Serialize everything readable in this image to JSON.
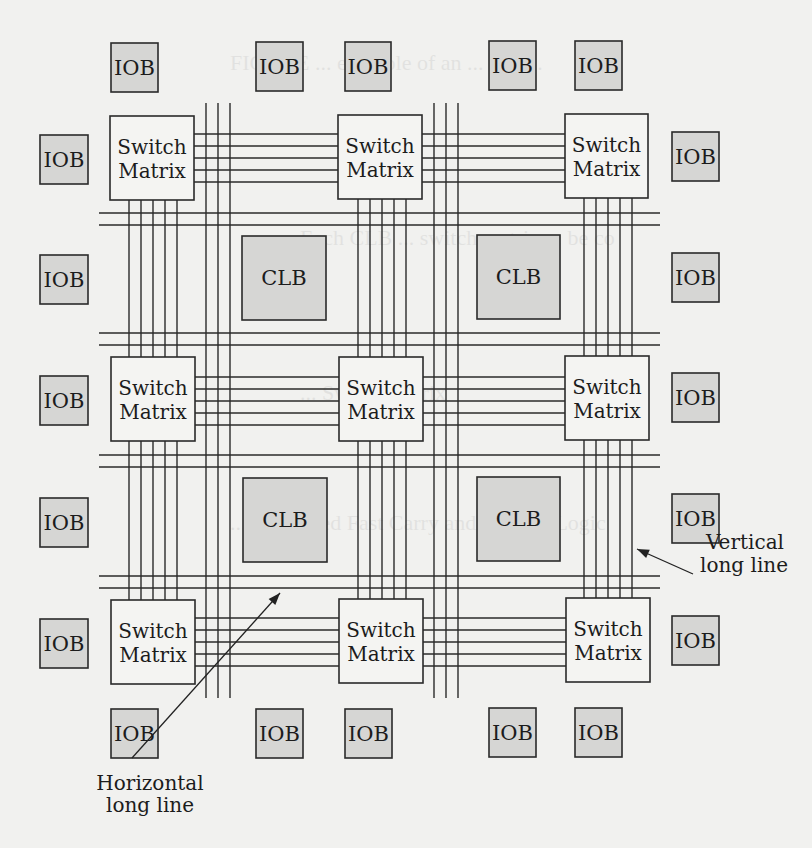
{
  "figure": {
    "colors": {
      "background": "#f1f1ef",
      "block_fill": "#d6d6d4",
      "switch_fill": "#f4f4f2",
      "stroke": "#2a2a2a"
    },
    "labels": {
      "iob": "IOB",
      "clb": "CLB",
      "switch_line1": "Switch",
      "switch_line2": "Matrix",
      "vertical_long_line_1": "Vertical",
      "vertical_long_line_2": "long line",
      "horizontal_long_line_1": "Horizontal",
      "horizontal_long_line_2": "long line"
    },
    "bleed_through_text": [
      "FIGURE ... example of an ... and ...",
      "Each CLB ... switch matrix ... be co",
      "... Switch matrix",
      "... Dedicated Fast Carry and Borrow Logic",
      "... Vertical long line"
    ]
  },
  "iobs": [
    {
      "id": "iob-top-1",
      "x": 111,
      "y": 43,
      "w": 47,
      "h": 49
    },
    {
      "id": "iob-top-2",
      "x": 256,
      "y": 42,
      "w": 47,
      "h": 49
    },
    {
      "id": "iob-top-3",
      "x": 345,
      "y": 42,
      "w": 46,
      "h": 49
    },
    {
      "id": "iob-top-4",
      "x": 489,
      "y": 41,
      "w": 47,
      "h": 49
    },
    {
      "id": "iob-top-5",
      "x": 575,
      "y": 41,
      "w": 47,
      "h": 49
    },
    {
      "id": "iob-left-1",
      "x": 40,
      "y": 135,
      "w": 48,
      "h": 49
    },
    {
      "id": "iob-left-2",
      "x": 40,
      "y": 255,
      "w": 48,
      "h": 49
    },
    {
      "id": "iob-left-3",
      "x": 40,
      "y": 376,
      "w": 48,
      "h": 49
    },
    {
      "id": "iob-left-4",
      "x": 40,
      "y": 498,
      "w": 48,
      "h": 49
    },
    {
      "id": "iob-left-5",
      "x": 40,
      "y": 619,
      "w": 48,
      "h": 49
    },
    {
      "id": "iob-right-1",
      "x": 672,
      "y": 132,
      "w": 47,
      "h": 49
    },
    {
      "id": "iob-right-2",
      "x": 672,
      "y": 253,
      "w": 47,
      "h": 49
    },
    {
      "id": "iob-right-3",
      "x": 672,
      "y": 373,
      "w": 47,
      "h": 49
    },
    {
      "id": "iob-right-4",
      "x": 672,
      "y": 494,
      "w": 47,
      "h": 49
    },
    {
      "id": "iob-right-5",
      "x": 672,
      "y": 616,
      "w": 47,
      "h": 49
    },
    {
      "id": "iob-bottom-1",
      "x": 111,
      "y": 709,
      "w": 47,
      "h": 49
    },
    {
      "id": "iob-bottom-2",
      "x": 256,
      "y": 709,
      "w": 47,
      "h": 49
    },
    {
      "id": "iob-bottom-3",
      "x": 345,
      "y": 709,
      "w": 47,
      "h": 49
    },
    {
      "id": "iob-bottom-4",
      "x": 489,
      "y": 708,
      "w": 47,
      "h": 49
    },
    {
      "id": "iob-bottom-5",
      "x": 575,
      "y": 708,
      "w": 47,
      "h": 49
    }
  ],
  "clbs": [
    {
      "id": "clb-1",
      "x": 242,
      "y": 236,
      "w": 84,
      "h": 84
    },
    {
      "id": "clb-2",
      "x": 477,
      "y": 235,
      "w": 83,
      "h": 84
    },
    {
      "id": "clb-3",
      "x": 243,
      "y": 478,
      "w": 84,
      "h": 84
    },
    {
      "id": "clb-4",
      "x": 477,
      "y": 477,
      "w": 83,
      "h": 84
    }
  ],
  "switch_matrices": [
    {
      "id": "sm-r1c1",
      "x": 110,
      "y": 116,
      "w": 84,
      "h": 84
    },
    {
      "id": "sm-r1c2",
      "x": 338,
      "y": 115,
      "w": 84,
      "h": 84
    },
    {
      "id": "sm-r1c3",
      "x": 565,
      "y": 114,
      "w": 83,
      "h": 84
    },
    {
      "id": "sm-r2c1",
      "x": 111,
      "y": 357,
      "w": 84,
      "h": 84
    },
    {
      "id": "sm-r2c2",
      "x": 339,
      "y": 357,
      "w": 84,
      "h": 84
    },
    {
      "id": "sm-r2c3",
      "x": 565,
      "y": 356,
      "w": 84,
      "h": 84
    },
    {
      "id": "sm-r3c1",
      "x": 111,
      "y": 600,
      "w": 84,
      "h": 84
    },
    {
      "id": "sm-r3c2",
      "x": 339,
      "y": 599,
      "w": 84,
      "h": 84
    },
    {
      "id": "sm-r3c3",
      "x": 566,
      "y": 598,
      "w": 84,
      "h": 84
    }
  ],
  "routing": {
    "short_h_row_y": [
      [
        134,
        146,
        158,
        170,
        182
      ],
      [
        377,
        389,
        401,
        413,
        425
      ],
      [
        618,
        630,
        642,
        654,
        666
      ]
    ],
    "short_v_col_x": [
      [
        129,
        141,
        153,
        165,
        177
      ],
      [
        358,
        370,
        382,
        394,
        406
      ],
      [
        584,
        596,
        608,
        620,
        632
      ]
    ],
    "long_v_x": [
      [
        206,
        218,
        230
      ],
      [
        434,
        446,
        458
      ]
    ],
    "long_v_range": [
      103,
      698
    ],
    "long_h_y": [
      [
        213,
        225
      ],
      [
        333,
        345
      ],
      [
        455,
        467
      ],
      [
        576,
        588
      ]
    ],
    "long_h_range": [
      99,
      660
    ]
  },
  "annotations": {
    "vertical": {
      "text_x": 700,
      "text_y1": 549,
      "text_y2": 572,
      "ax1": 693,
      "ay1": 574,
      "ax2": 637,
      "ay2": 549
    },
    "horizontal": {
      "text_x": 132,
      "text_y1": 790,
      "text_y2": 812,
      "ax1": 132,
      "ay1": 758,
      "ax2": 280,
      "ay2": 593
    }
  }
}
